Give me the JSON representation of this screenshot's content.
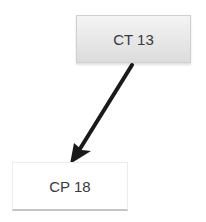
{
  "diagram": {
    "nodes": [
      {
        "id": "ct13",
        "label": "CT 13"
      },
      {
        "id": "cp18",
        "label": "CP 18"
      }
    ],
    "edges": [
      {
        "from": "ct13",
        "to": "cp18",
        "color": "#1a1a1a"
      }
    ]
  }
}
